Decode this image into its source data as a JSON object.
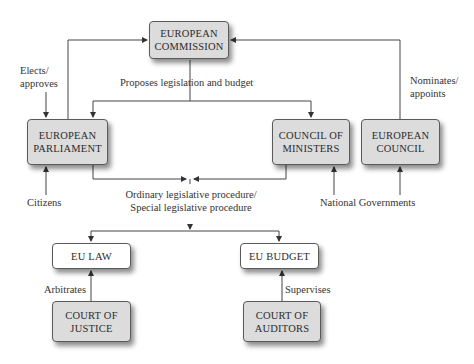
{
  "diagram": {
    "title": "",
    "nodes": {
      "european_commission": {
        "line1": "EUROPEAN",
        "line2": "COMMISSION"
      },
      "european_parliament": {
        "line1": "EUROPEAN",
        "line2": "PARLIAMENT"
      },
      "council_of_ministers": {
        "line1": "COUNCIL OF",
        "line2": "MINISTERS"
      },
      "european_council": {
        "line1": "EUROPEAN",
        "line2": "COUNCIL"
      },
      "eu_law": {
        "line1": "EU LAW"
      },
      "eu_budget": {
        "line1": "EU BUDGET"
      },
      "court_of_justice": {
        "line1": "COURT OF",
        "line2": "JUSTICE"
      },
      "court_of_auditors": {
        "line1": "COURT OF",
        "line2": "AUDITORS"
      }
    },
    "labels": {
      "elects_approves": {
        "line1": "Elects/",
        "line2": "approves"
      },
      "proposes": "Proposes legislation and budget",
      "nominates_appoints": {
        "line1": "Nominates/",
        "line2": "appoints"
      },
      "citizens": "Citizens",
      "procedure": {
        "line1": "Ordinary legislative procedure/",
        "line2": "Special legislative procedure"
      },
      "national_governments": "National Governments",
      "arbitrates": "Arbitrates",
      "supervises": "Supervises"
    },
    "colors": {
      "box_grey": "#dcdcdc",
      "box_white": "#ffffff",
      "line": "#444444"
    }
  }
}
